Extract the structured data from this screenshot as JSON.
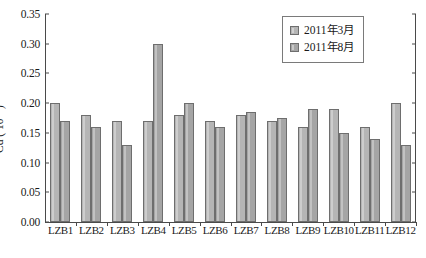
{
  "chart_data": {
    "type": "bar",
    "title": "",
    "xlabel": "",
    "ylabel": "Cd (10-6)",
    "ylabel_base": "Cd ( 10",
    "ylabel_exp": "-6",
    "ylabel_tail": " )",
    "ylim": [
      0.0,
      0.35
    ],
    "ytick_step": 0.05,
    "grid": false,
    "legend_position": "top-right",
    "categories": [
      "LZB1",
      "LZB2",
      "LZB3",
      "LZB4",
      "LZB5",
      "LZB6",
      "LZB7",
      "LZB8",
      "LZB9",
      "LZB10",
      "LZB11",
      "LZB12"
    ],
    "ytick_labels": [
      "0.00",
      "0.05",
      "0.10",
      "0.15",
      "0.20",
      "0.25",
      "0.30",
      "0.35"
    ],
    "ytick_values": [
      0.0,
      0.05,
      0.1,
      0.15,
      0.2,
      0.25,
      0.3,
      0.35
    ],
    "series": [
      {
        "name": "2011年3月",
        "color": "#b5b5b5",
        "values": [
          0.2,
          0.18,
          0.17,
          0.17,
          0.18,
          0.17,
          0.18,
          0.17,
          0.16,
          0.19,
          0.16,
          0.2
        ]
      },
      {
        "name": "2011年8月",
        "color": "#a5a5a5",
        "values": [
          0.17,
          0.16,
          0.13,
          0.3,
          0.2,
          0.16,
          0.185,
          0.175,
          0.19,
          0.15,
          0.14,
          0.13
        ]
      }
    ]
  },
  "legend": {
    "items": [
      {
        "label": "2011年3月"
      },
      {
        "label": "2011年8月"
      }
    ]
  }
}
